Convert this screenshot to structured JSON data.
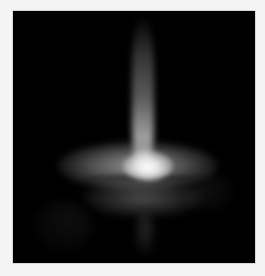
{
  "image": {
    "subject": "grayscale scattering pattern",
    "description": "Bright vertical streak above a horizontal bright band with central hotspot and fainter lower band on black background",
    "colors": {
      "background": "#000000",
      "page": "#f4f4f4",
      "highlight": "#ffffff"
    }
  }
}
